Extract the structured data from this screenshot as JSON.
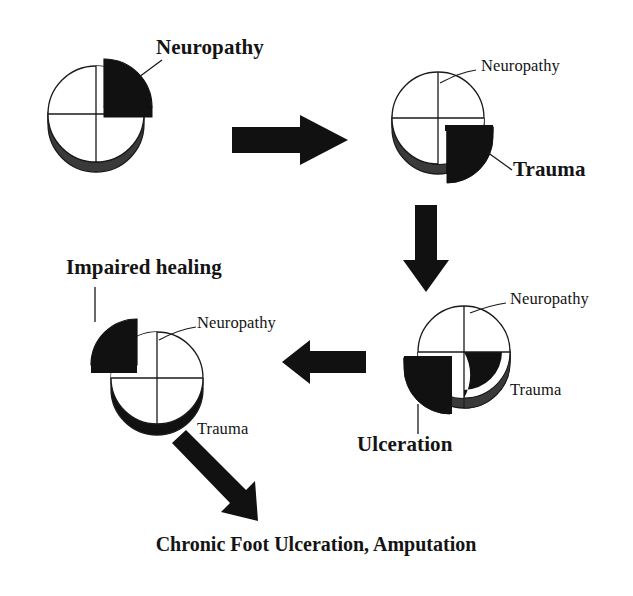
{
  "diagram": {
    "colors": {
      "ink": "#141414",
      "fill_black": "#111111",
      "depth_gray": "#3a3a3a",
      "outline": "#1a1a1a",
      "background": "#ffffff"
    },
    "stages": [
      {
        "id": "stage-1",
        "name": "neuropathy-pie",
        "center": {
          "x": 96,
          "y": 114
        },
        "radius": 48,
        "exploded_quadrant": "top-right",
        "callout_label": "Neuropathy",
        "callout_style": "bold",
        "inline_labels": []
      },
      {
        "id": "stage-2",
        "name": "trauma-pie",
        "center": {
          "x": 438,
          "y": 118
        },
        "radius": 46,
        "exploded_quadrant": "bottom-right",
        "callout_label": "Trauma",
        "callout_style": "bold",
        "inline_labels": [
          "Neuropathy"
        ]
      },
      {
        "id": "stage-3",
        "name": "ulceration-pie",
        "center": {
          "x": 464,
          "y": 352
        },
        "radius": 46,
        "exploded_quadrant": "bottom-left",
        "callout_label": "Ulceration",
        "callout_style": "bold",
        "inline_labels": [
          "Neuropathy",
          "Trauma"
        ]
      },
      {
        "id": "stage-4",
        "name": "impaired-healing-pie",
        "center": {
          "x": 157,
          "y": 378
        },
        "radius": 46,
        "exploded_quadrant": "top-left",
        "callout_label": "Impaired healing",
        "callout_style": "bold",
        "inline_labels": [
          "Neuropathy",
          "Trauma"
        ]
      }
    ],
    "labels": {
      "neuropathy_1": "Neuropathy",
      "neuropathy_2": "Neuropathy",
      "neuropathy_3": "Neuropathy",
      "neuropathy_4": "Neuropathy",
      "trauma_bold": "Trauma",
      "trauma_3": "Trauma",
      "trauma_4": "Trauma",
      "ulceration": "Ulceration",
      "impaired_healing": "Impaired healing",
      "outcome": "Chronic Foot Ulceration, Amputation"
    },
    "arrows": [
      {
        "name": "arrow-right-1",
        "direction": "right",
        "from_stage": "stage-1",
        "to_stage": "stage-2"
      },
      {
        "name": "arrow-down-1",
        "direction": "down",
        "from_stage": "stage-2",
        "to_stage": "stage-3"
      },
      {
        "name": "arrow-left-1",
        "direction": "left",
        "from_stage": "stage-3",
        "to_stage": "stage-4"
      },
      {
        "name": "arrow-diagonal-1",
        "direction": "down-right",
        "from_stage": "stage-4",
        "to_stage": "outcome"
      }
    ]
  }
}
